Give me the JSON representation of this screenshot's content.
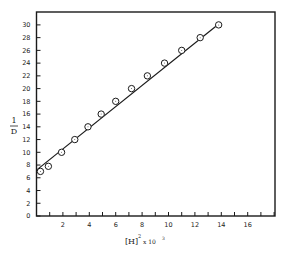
{
  "chart_data": {
    "type": "scatter",
    "title": "",
    "xlabel": "[H]^2 x 10^3",
    "ylabel": "1/D",
    "xlim": [
      0,
      18
    ],
    "ylim": [
      0,
      32
    ],
    "x_ticks": [
      2,
      4,
      6,
      8,
      10,
      12,
      14,
      16
    ],
    "y_ticks": [
      0,
      2,
      4,
      6,
      8,
      10,
      12,
      14,
      16,
      18,
      20,
      22,
      24,
      26,
      28,
      30
    ],
    "grid": false,
    "legend": null,
    "series": [
      {
        "name": "data",
        "marker": "open-circle",
        "x": [
          0.3,
          0.9,
          1.9,
          2.9,
          3.9,
          4.9,
          6.0,
          7.2,
          8.4,
          9.7,
          11.0,
          12.4,
          13.8
        ],
        "y": [
          7.0,
          7.8,
          10.0,
          12.0,
          14.0,
          16.0,
          18.0,
          20.0,
          22.0,
          24.0,
          26.0,
          28.0,
          30.0
        ]
      }
    ],
    "fit_line": {
      "x": [
        0,
        13.9
      ],
      "y": [
        7.2,
        30.3
      ]
    }
  },
  "labels": {
    "ylabel_num": "1",
    "ylabel_den": "D",
    "xlabel_main": "[H]",
    "xlabel_sup": "2",
    "xlabel_suffix": "x 10",
    "xlabel_exp": "3"
  }
}
